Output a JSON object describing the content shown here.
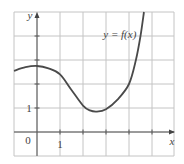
{
  "chart_data": {
    "type": "line",
    "title": "",
    "xlabel": "x",
    "ylabel": "y",
    "xlim": [
      -1,
      6
    ],
    "ylim": [
      -1,
      5
    ],
    "grid": true,
    "tick_labels": {
      "x": [
        "1"
      ],
      "y": [
        "1"
      ],
      "origin": "0"
    },
    "annotations": [
      {
        "text": "y = f(x)",
        "x": 3.6,
        "y": 3.9
      }
    ],
    "series": [
      {
        "name": "y = f(x)",
        "points": [
          [
            -1,
            2.55
          ],
          [
            -0.5,
            2.7
          ],
          [
            0,
            2.75
          ],
          [
            0.5,
            2.65
          ],
          [
            1,
            2.4
          ],
          [
            1.5,
            1.75
          ],
          [
            2,
            1.1
          ],
          [
            2.3,
            0.9
          ],
          [
            2.6,
            0.85
          ],
          [
            3,
            0.95
          ],
          [
            3.5,
            1.35
          ],
          [
            4,
            2.0
          ],
          [
            4.3,
            3.0
          ],
          [
            4.5,
            4.0
          ],
          [
            4.65,
            5.0
          ]
        ]
      }
    ]
  }
}
